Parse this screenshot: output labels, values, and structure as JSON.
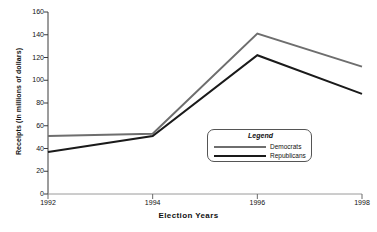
{
  "chart_data": {
    "type": "line",
    "title": "",
    "xlabel": "Election Years",
    "ylabel": "Receipts (In millions of dollars)",
    "x": [
      1992,
      1994,
      1996,
      1998
    ],
    "xticklabels": [
      "1992",
      "1994",
      "1996",
      "1998"
    ],
    "yticklabels": [
      "0",
      "20",
      "40",
      "60",
      "80",
      "100",
      "120",
      "140",
      "160"
    ],
    "yticks": [
      0,
      20,
      40,
      60,
      80,
      100,
      120,
      140,
      160
    ],
    "ylim": [
      0,
      160
    ],
    "grid": false,
    "legend_position": "center-right",
    "legend_title": "Legend",
    "series": [
      {
        "name": "Democrats",
        "color": "#6e6e6e",
        "values": [
          51,
          53,
          141,
          112
        ]
      },
      {
        "name": "Republicans",
        "color": "#1a1a1a",
        "values": [
          37,
          51,
          122,
          88
        ]
      }
    ]
  }
}
